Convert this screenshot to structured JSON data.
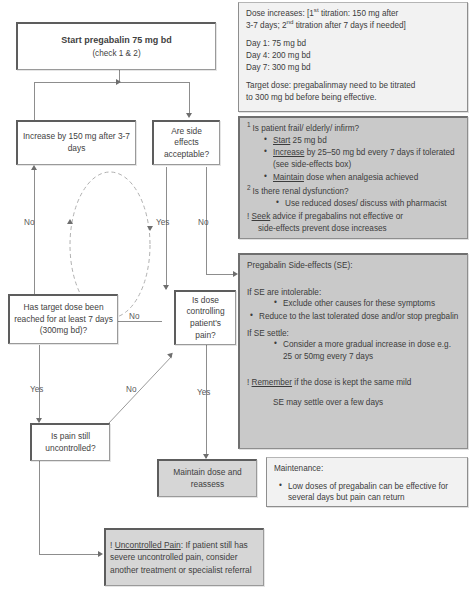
{
  "nodes": {
    "start": {
      "title": "Start pregabalin 75 mg bd",
      "sub": "(check 1 & 2)"
    },
    "increase": {
      "text": "Increase by 150 mg after 3-7 days"
    },
    "side_effects_q": {
      "text": "Are side effects acceptable?"
    },
    "target_dose_q": {
      "text": "Has target dose been reached for at least 7 days (300mg bd)?"
    },
    "dose_controlling_q": {
      "text": "Is dose controlling patient's pain?"
    },
    "pain_still_q": {
      "text": "Is pain still uncontrolled?"
    },
    "maintain": {
      "text": "Maintain dose and reassess"
    },
    "uncontrolled_pain": {
      "lead_mark": "!",
      "lead_underlined": "Uncontrolled Pain",
      "text": ": If patient still has severe uncontrolled pain, consider another treatment or specialist referral"
    }
  },
  "edges": {
    "no": "No",
    "yes": "Yes",
    "labels": {
      "increase_no": "No",
      "se_yes": "Yes",
      "se_no": "No",
      "dose_no": "No",
      "target_yes": "Yes",
      "diag_no": "No",
      "controlling_yes": "Yes"
    }
  },
  "panels": {
    "dosing": {
      "line1_a": "Dose increases: [1",
      "line1_sup": "st",
      "line1_b": " titration: 150 mg after",
      "line2_a": "3-7 days; 2",
      "line2_sup": "nd",
      "line2_b": " titration after 7 days if needed]",
      "day1": "Day 1: 75 mg bd",
      "day4": "Day 4: 200 mg bd",
      "day7": "Day 7: 300 mg bd",
      "target_line1": "Target dose: pregabalinmay need to be titrated",
      "target_line2": "to 300 mg bd before being effective."
    },
    "checks": {
      "q1_num": "1",
      "q1": "Is patient frail/ elderly/ infirm?",
      "q1_bullets": [
        {
          "verb": "Start",
          "rest": " 25 mg bd"
        },
        {
          "verb": "Increase",
          "rest": " by 25–50 mg bd every 7 days if tolerated (see side-effects box)"
        },
        {
          "verb": "Maintain",
          "rest": " dose when analgesia achieved"
        }
      ],
      "q2_num": "2",
      "q2": "Is there renal dysfunction?",
      "q2_bullets": [
        {
          "verb": "",
          "rest": "Use reduced doses/ discuss with pharmacist"
        }
      ],
      "seek_mark": "!",
      "seek_verb": "Seek",
      "seek_rest": " advice if pregabalins not effective or",
      "seek_line2": "side-effects prevent dose increases"
    },
    "side_effects": {
      "title": "Pregabalin Side-effects (SE):",
      "intolerable_head": "If SE are intolerable:",
      "intolerable_b1": "Exclude other causes for these symptoms",
      "intolerable_b2": "Reduce to the last tolerated dose and/or stop pregbalin",
      "settle_head": "If SE settle:",
      "settle_b1": "Consider a more gradual increase in dose e.g. 25 or 50mg every 7 days",
      "remember_mark": "!",
      "remember_verb": "Remember",
      "remember_rest": " if the dose is kept the same mild",
      "remember_line2": "SE may settle over a few days"
    },
    "maintenance": {
      "title": "Maintenance:",
      "bullet": "Low doses of pregabalin can be effective for several days but pain can return"
    }
  },
  "colors": {
    "panel_grey": "#c9c9c9",
    "panel_light": "#f2f2f2",
    "node_filled": "#d6d6d6",
    "line": "#8d8d8d",
    "text": "#3c3c3c"
  }
}
